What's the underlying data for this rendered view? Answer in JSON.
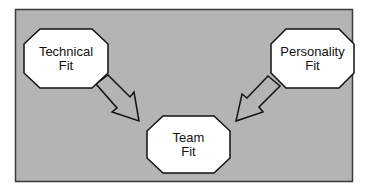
{
  "diagram": {
    "type": "flow",
    "colors": {
      "panel_fill": "#b4b4b4",
      "panel_border": "#3a3a3a",
      "node_fill": "#ffffff",
      "node_stroke": "#111111",
      "arrow_fill": "#b4b4b4",
      "arrow_stroke": "#111111",
      "text": "#111111"
    },
    "nodes": [
      {
        "id": "technical",
        "line1": "Technical",
        "line2": "Fit"
      },
      {
        "id": "personality",
        "line1": "Personality",
        "line2": "Fit"
      },
      {
        "id": "team",
        "line1": "Team",
        "line2": "Fit"
      }
    ],
    "edges": [
      {
        "from": "technical",
        "to": "team"
      },
      {
        "from": "personality",
        "to": "team"
      }
    ]
  }
}
